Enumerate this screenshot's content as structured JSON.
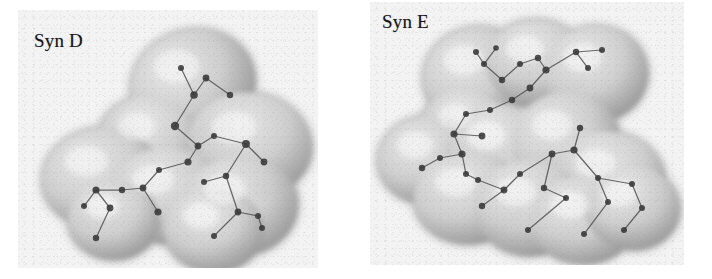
{
  "figure": {
    "type": "scientific-figure",
    "background_color": "#ffffff",
    "panel_background_color": "#f3f3f3",
    "surface_color": "#cfcfcf",
    "surface_shadow_color": "#8e8e8e",
    "surface_highlight_color": "#ececec",
    "atom_color": "#3a3a3a",
    "bond_color": "#555555",
    "label_color": "#18181a"
  },
  "panels": [
    {
      "id": "syn-d",
      "label": "Syn D",
      "label_position": "top-left",
      "geometry": {
        "x": 18,
        "y": 10,
        "width": 300,
        "height": 258
      },
      "molecule": {
        "name": "Syn D",
        "rendering": "space-filling surface with wireframe skeleton",
        "lobes": [
          {
            "cx": 175,
            "cy": 75,
            "rx": 63,
            "ry": 55,
            "rot": -18
          },
          {
            "cx": 132,
            "cy": 132,
            "rx": 52,
            "ry": 45,
            "rot": 10
          },
          {
            "cx": 232,
            "cy": 135,
            "rx": 62,
            "ry": 52,
            "rot": 8
          },
          {
            "cx": 84,
            "cy": 168,
            "rx": 60,
            "ry": 50,
            "rot": -8
          },
          {
            "cx": 150,
            "cy": 186,
            "rx": 58,
            "ry": 48,
            "rot": 4
          },
          {
            "cx": 222,
            "cy": 196,
            "rx": 58,
            "ry": 50,
            "rot": -6
          },
          {
            "cx": 96,
            "cy": 210,
            "rx": 46,
            "ry": 40,
            "rot": 0
          },
          {
            "cx": 196,
            "cy": 220,
            "rx": 50,
            "ry": 42,
            "rot": 0
          }
        ],
        "atoms": [
          {
            "x": 163,
            "y": 58,
            "r": 3.0
          },
          {
            "x": 188,
            "y": 68,
            "r": 3.4
          },
          {
            "x": 176,
            "y": 85,
            "r": 3.8
          },
          {
            "x": 212,
            "y": 85,
            "r": 3.2
          },
          {
            "x": 157,
            "y": 116,
            "r": 4.2
          },
          {
            "x": 180,
            "y": 136,
            "r": 3.4
          },
          {
            "x": 196,
            "y": 126,
            "r": 3.0
          },
          {
            "x": 170,
            "y": 152,
            "r": 3.6
          },
          {
            "x": 228,
            "y": 134,
            "r": 4.0
          },
          {
            "x": 246,
            "y": 152,
            "r": 3.4
          },
          {
            "x": 208,
            "y": 166,
            "r": 3.2
          },
          {
            "x": 186,
            "y": 172,
            "r": 3.0
          },
          {
            "x": 141,
            "y": 160,
            "r": 3.0
          },
          {
            "x": 125,
            "y": 178,
            "r": 3.4
          },
          {
            "x": 104,
            "y": 180,
            "r": 3.2
          },
          {
            "x": 78,
            "y": 180,
            "r": 3.6
          },
          {
            "x": 66,
            "y": 196,
            "r": 3.0
          },
          {
            "x": 92,
            "y": 198,
            "r": 3.4
          },
          {
            "x": 140,
            "y": 202,
            "r": 3.6
          },
          {
            "x": 220,
            "y": 202,
            "r": 3.4
          },
          {
            "x": 240,
            "y": 206,
            "r": 3.0
          },
          {
            "x": 78,
            "y": 228,
            "r": 3.2
          },
          {
            "x": 196,
            "y": 226,
            "r": 3.0
          },
          {
            "x": 244,
            "y": 218,
            "r": 3.0
          }
        ],
        "bonds": [
          [
            0,
            2
          ],
          [
            1,
            2
          ],
          [
            2,
            4
          ],
          [
            3,
            1
          ],
          [
            4,
            5
          ],
          [
            5,
            6
          ],
          [
            6,
            8
          ],
          [
            8,
            9
          ],
          [
            5,
            7
          ],
          [
            7,
            12
          ],
          [
            12,
            13
          ],
          [
            13,
            14
          ],
          [
            14,
            15
          ],
          [
            15,
            16
          ],
          [
            15,
            17
          ],
          [
            13,
            18
          ],
          [
            8,
            10
          ],
          [
            10,
            11
          ],
          [
            10,
            19
          ],
          [
            19,
            20
          ],
          [
            17,
            21
          ],
          [
            19,
            22
          ],
          [
            20,
            23
          ]
        ]
      }
    },
    {
      "id": "syn-e",
      "label": "Syn E",
      "label_position": "top-left",
      "geometry": {
        "x": 370,
        "y": 2,
        "width": 314,
        "height": 263
      },
      "molecule": {
        "name": "Syn E",
        "rendering": "space-filling surface with wireframe skeleton",
        "lobes": [
          {
            "cx": 108,
            "cy": 75,
            "rx": 55,
            "ry": 50,
            "rot": -12
          },
          {
            "cx": 168,
            "cy": 62,
            "rx": 52,
            "ry": 44,
            "rot": 6
          },
          {
            "cx": 226,
            "cy": 72,
            "rx": 52,
            "ry": 48,
            "rot": -4
          },
          {
            "cx": 96,
            "cy": 128,
            "rx": 46,
            "ry": 40,
            "rot": 12
          },
          {
            "cx": 58,
            "cy": 158,
            "rx": 50,
            "ry": 44,
            "rot": -6
          },
          {
            "cx": 130,
            "cy": 150,
            "rx": 54,
            "ry": 48,
            "rot": 6
          },
          {
            "cx": 196,
            "cy": 140,
            "rx": 54,
            "ry": 50,
            "rot": -8
          },
          {
            "cx": 240,
            "cy": 178,
            "rx": 56,
            "ry": 48,
            "rot": 10
          },
          {
            "cx": 100,
            "cy": 196,
            "rx": 56,
            "ry": 46,
            "rot": -4
          },
          {
            "cx": 160,
            "cy": 206,
            "rx": 56,
            "ry": 48,
            "rot": 2
          },
          {
            "cx": 214,
            "cy": 218,
            "rx": 54,
            "ry": 44,
            "rot": -2
          },
          {
            "cx": 262,
            "cy": 206,
            "rx": 48,
            "ry": 42,
            "rot": 6
          }
        ],
        "atoms": [
          {
            "x": 106,
            "y": 50,
            "r": 3.0
          },
          {
            "x": 126,
            "y": 46,
            "r": 2.8
          },
          {
            "x": 114,
            "y": 62,
            "r": 3.0
          },
          {
            "x": 132,
            "y": 78,
            "r": 3.2
          },
          {
            "x": 150,
            "y": 62,
            "r": 3.0
          },
          {
            "x": 168,
            "y": 56,
            "r": 3.2
          },
          {
            "x": 176,
            "y": 68,
            "r": 3.6
          },
          {
            "x": 206,
            "y": 50,
            "r": 3.2
          },
          {
            "x": 218,
            "y": 66,
            "r": 3.0
          },
          {
            "x": 232,
            "y": 48,
            "r": 3.0
          },
          {
            "x": 160,
            "y": 86,
            "r": 3.4
          },
          {
            "x": 142,
            "y": 98,
            "r": 3.2
          },
          {
            "x": 120,
            "y": 108,
            "r": 3.0
          },
          {
            "x": 96,
            "y": 112,
            "r": 3.0
          },
          {
            "x": 84,
            "y": 132,
            "r": 3.6
          },
          {
            "x": 112,
            "y": 134,
            "r": 3.4
          },
          {
            "x": 92,
            "y": 152,
            "r": 3.6
          },
          {
            "x": 70,
            "y": 156,
            "r": 3.0
          },
          {
            "x": 52,
            "y": 166,
            "r": 3.2
          },
          {
            "x": 96,
            "y": 172,
            "r": 3.0
          },
          {
            "x": 108,
            "y": 178,
            "r": 3.0
          },
          {
            "x": 134,
            "y": 188,
            "r": 3.4
          },
          {
            "x": 112,
            "y": 204,
            "r": 3.2
          },
          {
            "x": 150,
            "y": 172,
            "r": 3.0
          },
          {
            "x": 182,
            "y": 152,
            "r": 3.4
          },
          {
            "x": 204,
            "y": 148,
            "r": 3.6
          },
          {
            "x": 210,
            "y": 126,
            "r": 3.2
          },
          {
            "x": 174,
            "y": 186,
            "r": 3.2
          },
          {
            "x": 196,
            "y": 196,
            "r": 3.0
          },
          {
            "x": 228,
            "y": 176,
            "r": 3.0
          },
          {
            "x": 238,
            "y": 200,
            "r": 3.0
          },
          {
            "x": 262,
            "y": 182,
            "r": 3.0
          },
          {
            "x": 272,
            "y": 206,
            "r": 3.0
          },
          {
            "x": 214,
            "y": 232,
            "r": 3.0
          },
          {
            "x": 158,
            "y": 228,
            "r": 3.0
          },
          {
            "x": 254,
            "y": 228,
            "r": 3.0
          }
        ],
        "bonds": [
          [
            0,
            2
          ],
          [
            1,
            2
          ],
          [
            2,
            3
          ],
          [
            3,
            4
          ],
          [
            4,
            5
          ],
          [
            5,
            6
          ],
          [
            6,
            7
          ],
          [
            7,
            8
          ],
          [
            7,
            9
          ],
          [
            6,
            10
          ],
          [
            10,
            11
          ],
          [
            11,
            12
          ],
          [
            12,
            13
          ],
          [
            13,
            14
          ],
          [
            14,
            15
          ],
          [
            14,
            16
          ],
          [
            16,
            17
          ],
          [
            17,
            18
          ],
          [
            16,
            19
          ],
          [
            19,
            20
          ],
          [
            20,
            21
          ],
          [
            21,
            22
          ],
          [
            21,
            23
          ],
          [
            23,
            24
          ],
          [
            24,
            25
          ],
          [
            25,
            26
          ],
          [
            24,
            27
          ],
          [
            27,
            28
          ],
          [
            25,
            29
          ],
          [
            29,
            30
          ],
          [
            29,
            31
          ],
          [
            31,
            32
          ],
          [
            30,
            33
          ],
          [
            28,
            34
          ],
          [
            32,
            35
          ]
        ]
      }
    }
  ]
}
